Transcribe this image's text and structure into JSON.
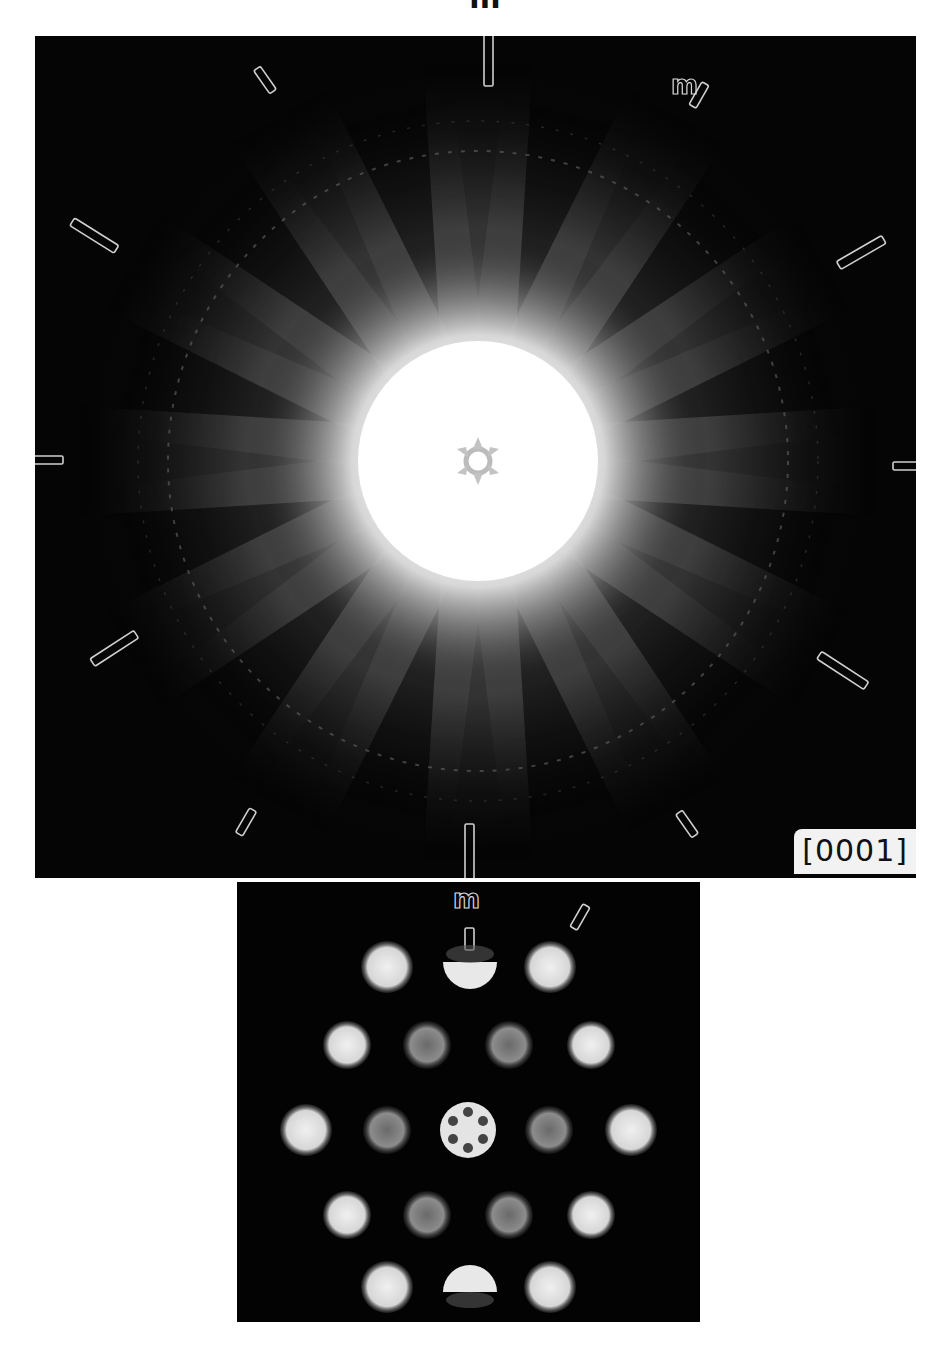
{
  "figure": {
    "top_label": "m",
    "main_pattern": {
      "zone_axis_label": "[0001]",
      "mirror_label_upper_right": "m",
      "description": "Convergent-beam electron diffraction whole-pattern, six-fold symmetry",
      "colors": {
        "background": "#050505",
        "center": "#ffffff",
        "marker_outline": "#d0d0d0"
      }
    },
    "disk_pattern": {
      "mirror_label": "m",
      "rows": [
        3,
        4,
        5,
        4,
        3
      ],
      "total_disks": 19
    }
  }
}
